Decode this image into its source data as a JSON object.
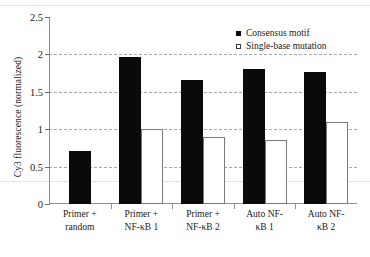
{
  "chart_data": {
    "type": "bar",
    "title": "",
    "xlabel": "",
    "ylabel": "Cy3 fluorescence (normalized)",
    "ylim": [
      0,
      2.5
    ],
    "yticks": [
      0,
      0.5,
      1,
      1.5,
      2,
      2.5
    ],
    "ytick_labels": [
      "0",
      "0.5",
      "1",
      "1.5",
      "2",
      "2.5"
    ],
    "grid": true,
    "grid_style": "dashed horizontal",
    "legend_position": "top-right",
    "categories": [
      "Primer + random",
      "Primer + NF-κB 1",
      "Primer + NF-κB 2",
      "Auto NF-κB 1",
      "Auto NF-κB 2"
    ],
    "category_lines": [
      [
        "Primer +",
        "random"
      ],
      [
        "Primer +",
        "NF-κB 1"
      ],
      [
        "Primer +",
        "NF-κB 2"
      ],
      [
        "Auto NF-",
        "κB 1"
      ],
      [
        "Auto NF-",
        "κB 2"
      ]
    ],
    "series": [
      {
        "name": "Consensus motif",
        "color": "#0a0a0a",
        "marker": "filled-square",
        "values": [
          0.71,
          1.96,
          1.66,
          1.81,
          1.77
        ]
      },
      {
        "name": "Single-base mutation",
        "color": "#ffffff",
        "marker": "open-square",
        "values": [
          null,
          1.0,
          0.89,
          0.85,
          1.1
        ]
      }
    ]
  },
  "legend": {
    "entries": [
      {
        "label": "Consensus motif",
        "style": "filled"
      },
      {
        "label": "Single-base mutation",
        "style": "open"
      }
    ]
  }
}
